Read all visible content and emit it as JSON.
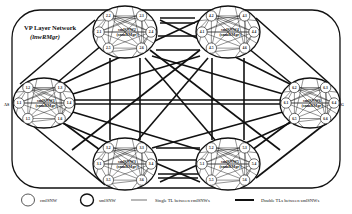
{
  "diagram": {
    "title": "VP Layer Network",
    "subtitle": "(lnwRMgr)",
    "side_labels": {
      "left": "AS",
      "right": "EG"
    },
    "clusters": [
      {
        "id": "1",
        "name": "smlSNW1",
        "manager": "(snmRMgr)",
        "nodes": [
          "1.1",
          "1.2",
          "1.3",
          "1.4",
          "1.5",
          "1.6"
        ]
      },
      {
        "id": "2",
        "name": "smlSNW2",
        "manager": "(snmRMgr)",
        "nodes": [
          "2.1",
          "2.2",
          "2.3",
          "2.4",
          "2.5",
          "2.6"
        ]
      },
      {
        "id": "3",
        "name": "smlSNW3",
        "manager": "(snmRMgr)",
        "nodes": [
          "3.1",
          "3.2",
          "3.3",
          "3.4",
          "3.5",
          "3.6"
        ]
      },
      {
        "id": "4",
        "name": "smlSNW4",
        "manager": "(snmRMgr)",
        "nodes": [
          "4.1",
          "4.2",
          "4.3",
          "4.4",
          "4.5",
          "4.6"
        ]
      },
      {
        "id": "5",
        "name": "smlSNW5",
        "manager": "(snmRMgr)",
        "nodes": [
          "5.1",
          "5.2",
          "5.3",
          "5.4",
          "5.5",
          "5.6"
        ]
      },
      {
        "id": "6",
        "name": "smlSNW6",
        "manager": "(snmRMgr)",
        "nodes": [
          "6.1",
          "6.2",
          "6.3",
          "6.4",
          "6.5",
          "6.6"
        ]
      }
    ]
  },
  "legend": {
    "thin_circle": "cmlSNW",
    "thick_circle": "smlSNW",
    "single_line": "Single TL between cmlSNWs",
    "double_line": "Double TLs between smlSNWs"
  },
  "colors": {
    "stroke": "#111111",
    "background": "#ffffff"
  }
}
